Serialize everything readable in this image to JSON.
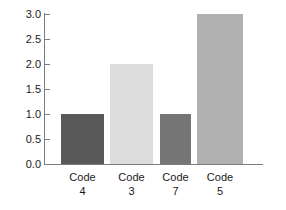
{
  "chart_data": {
    "type": "bar",
    "title": "",
    "subtitle": "",
    "xlabel": "",
    "ylabel": "",
    "categories": [
      "Code 4",
      "Code 3",
      "Code 7",
      "Code 5"
    ],
    "category_lines": [
      {
        "line1": "Code",
        "line2": "4"
      },
      {
        "line1": "Code",
        "line2": "3"
      },
      {
        "line1": "Code",
        "line2": "7"
      },
      {
        "line1": "Code",
        "line2": "5"
      }
    ],
    "values": [
      1.0,
      2.0,
      1.0,
      3.0
    ],
    "bar_colors": [
      "#595959",
      "#dcdcdc",
      "#757575",
      "#b0b0b0"
    ],
    "ylim": [
      0.0,
      3.0
    ],
    "ytick_values": [
      0.0,
      0.5,
      1.0,
      1.5,
      2.0,
      2.5,
      3.0
    ],
    "ytick_labels": [
      "0.0",
      "0.5",
      "1.0",
      "1.5",
      "2.0",
      "2.5",
      "3.0"
    ],
    "grid": false,
    "legend": null,
    "axis_color": "#7d7d7d",
    "text_color": "#1a1a1a",
    "background": "#ffffff",
    "bars": [
      {
        "category": "Code 4",
        "value": 1.0,
        "color": "#595959",
        "x": 61,
        "width": 43
      },
      {
        "category": "Code 3",
        "value": 2.0,
        "color": "#dcdcdc",
        "x": 110,
        "width": 43
      },
      {
        "category": "Code 7",
        "value": 1.0,
        "color": "#757575",
        "x": 160,
        "width": 31
      },
      {
        "category": "Code 5",
        "value": 3.0,
        "color": "#b0b0b0",
        "x": 197,
        "width": 46
      }
    ]
  }
}
